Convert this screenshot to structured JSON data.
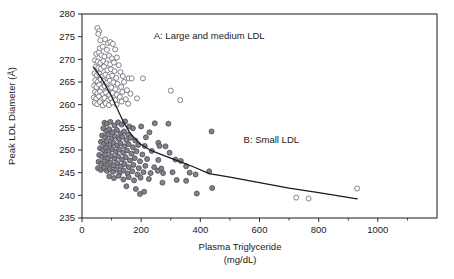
{
  "chart_data": {
    "type": "scatter",
    "title": "",
    "xlabel": "Plasma Triglyceride",
    "xlabel_units": "(mg/dL)",
    "ylabel": "Peak LDL Diameter (Å)",
    "xlim": [
      0,
      1200
    ],
    "ylim": [
      235,
      280
    ],
    "grid": false,
    "legend_position": "none",
    "x_ticks": [
      0,
      200,
      400,
      600,
      800,
      1000
    ],
    "x_tick_labels": [
      "0",
      "200",
      "400",
      "600",
      "800",
      "1000"
    ],
    "x_minor_ticks": [
      100,
      300,
      500,
      700,
      900,
      1100
    ],
    "y_ticks": [
      235,
      240,
      245,
      250,
      255,
      260,
      265,
      270,
      275,
      280
    ],
    "y_tick_labels": [
      "235",
      "240",
      "245",
      "250",
      "255",
      "260",
      "265",
      "270",
      "275",
      "280"
    ],
    "annotations": [
      {
        "text": "A: Large and medium LDL",
        "x": 430,
        "y": 274.5
      },
      {
        "text": "B: Small LDL",
        "x": 640,
        "y": 251.5
      }
    ],
    "series": [
      {
        "name": "Phenotype A (large/medium LDL)",
        "marker": "open-circle",
        "marker_color": "#ffffff",
        "marker_edge_color": "#6e6e76",
        "points": [
          [
            52,
            276.9
          ],
          [
            58,
            276.2
          ],
          [
            55,
            275.6
          ],
          [
            62,
            274.2
          ],
          [
            78,
            274.4
          ],
          [
            88,
            273.6
          ],
          [
            96,
            273.8
          ],
          [
            104,
            273.4
          ],
          [
            60,
            272.4
          ],
          [
            70,
            272.8
          ],
          [
            84,
            272.1
          ],
          [
            112,
            272.2
          ],
          [
            48,
            271.2
          ],
          [
            57,
            271.5
          ],
          [
            66,
            270.9
          ],
          [
            76,
            270.6
          ],
          [
            92,
            270.8
          ],
          [
            101,
            270.2
          ],
          [
            118,
            270.4
          ],
          [
            44,
            269.8
          ],
          [
            53,
            269.5
          ],
          [
            62,
            269.2
          ],
          [
            72,
            269.6
          ],
          [
            83,
            269.1
          ],
          [
            95,
            268.9
          ],
          [
            108,
            269.3
          ],
          [
            124,
            268.7
          ],
          [
            46,
            268.3
          ],
          [
            55,
            268.1
          ],
          [
            64,
            267.9
          ],
          [
            74,
            268.4
          ],
          [
            86,
            267.6
          ],
          [
            98,
            267.8
          ],
          [
            110,
            267.4
          ],
          [
            130,
            267.2
          ],
          [
            42,
            266.9
          ],
          [
            50,
            266.5
          ],
          [
            59,
            266.8
          ],
          [
            68,
            266.2
          ],
          [
            79,
            266.6
          ],
          [
            90,
            266.1
          ],
          [
            102,
            266.4
          ],
          [
            116,
            265.9
          ],
          [
            138,
            266.3
          ],
          [
            158,
            265.8
          ],
          [
            45,
            265.4
          ],
          [
            54,
            265.1
          ],
          [
            63,
            265.6
          ],
          [
            73,
            265.2
          ],
          [
            84,
            264.8
          ],
          [
            94,
            265.3
          ],
          [
            106,
            264.9
          ],
          [
            120,
            264.6
          ],
          [
            142,
            265.0
          ],
          [
            168,
            265.8
          ],
          [
            41,
            264.2
          ],
          [
            49,
            263.9
          ],
          [
            58,
            264.4
          ],
          [
            67,
            263.7
          ],
          [
            77,
            264.1
          ],
          [
            88,
            263.5
          ],
          [
            99,
            263.8
          ],
          [
            113,
            263.4
          ],
          [
            132,
            263.9
          ],
          [
            152,
            263.2
          ],
          [
            44,
            262.8
          ],
          [
            52,
            262.5
          ],
          [
            61,
            262.9
          ],
          [
            71,
            262.3
          ],
          [
            81,
            262.7
          ],
          [
            92,
            262.1
          ],
          [
            104,
            262.6
          ],
          [
            118,
            262.2
          ],
          [
            136,
            262.8
          ],
          [
            164,
            262.4
          ],
          [
            40,
            261.6
          ],
          [
            48,
            261.3
          ],
          [
            57,
            261.8
          ],
          [
            66,
            261.1
          ],
          [
            76,
            261.5
          ],
          [
            87,
            260.9
          ],
          [
            98,
            261.4
          ],
          [
            112,
            261.0
          ],
          [
            128,
            261.7
          ],
          [
            148,
            261.2
          ],
          [
            186,
            261.4
          ],
          [
            43,
            260.4
          ],
          [
            51,
            260.1
          ],
          [
            60,
            260.6
          ],
          [
            70,
            259.8
          ],
          [
            80,
            260.3
          ],
          [
            91,
            259.9
          ],
          [
            103,
            260.5
          ],
          [
            117,
            260.0
          ],
          [
            134,
            260.7
          ],
          [
            156,
            260.2
          ],
          [
            300,
            263.1
          ],
          [
            332,
            261.0
          ],
          [
            206,
            265.8
          ],
          [
            724,
            239.5
          ],
          [
            766,
            239.3
          ],
          [
            930,
            241.5
          ]
        ]
      },
      {
        "name": "Phenotype B (small LDL)",
        "marker": "filled-circle",
        "marker_color": "#82828c",
        "marker_edge_color": "#4a4a52",
        "points": [
          [
            76,
            256.0
          ],
          [
            84,
            255.8
          ],
          [
            96,
            256.2
          ],
          [
            110,
            255.4
          ],
          [
            122,
            256.1
          ],
          [
            134,
            255.6
          ],
          [
            146,
            256.3
          ],
          [
            160,
            255.2
          ],
          [
            246,
            255.9
          ],
          [
            292,
            255.8
          ],
          [
            72,
            254.8
          ],
          [
            82,
            254.2
          ],
          [
            92,
            254.6
          ],
          [
            104,
            253.9
          ],
          [
            118,
            254.4
          ],
          [
            130,
            253.6
          ],
          [
            142,
            254.1
          ],
          [
            156,
            253.4
          ],
          [
            172,
            254.8
          ],
          [
            200,
            255.2
          ],
          [
            228,
            253.9
          ],
          [
            438,
            254.1
          ],
          [
            68,
            253.2
          ],
          [
            78,
            252.8
          ],
          [
            88,
            253.4
          ],
          [
            100,
            252.6
          ],
          [
            112,
            253.0
          ],
          [
            124,
            252.4
          ],
          [
            136,
            252.9
          ],
          [
            150,
            252.2
          ],
          [
            164,
            252.7
          ],
          [
            180,
            252.1
          ],
          [
            216,
            252.8
          ],
          [
            258,
            251.6
          ],
          [
            64,
            251.8
          ],
          [
            74,
            251.4
          ],
          [
            84,
            251.9
          ],
          [
            95,
            251.2
          ],
          [
            106,
            251.6
          ],
          [
            118,
            251.0
          ],
          [
            130,
            251.5
          ],
          [
            143,
            250.8
          ],
          [
            157,
            251.3
          ],
          [
            172,
            250.6
          ],
          [
            190,
            251.1
          ],
          [
            212,
            250.9
          ],
          [
            262,
            250.9
          ],
          [
            282,
            250.8
          ],
          [
            61,
            250.4
          ],
          [
            71,
            250.0
          ],
          [
            81,
            250.5
          ],
          [
            91,
            249.8
          ],
          [
            102,
            250.2
          ],
          [
            114,
            249.6
          ],
          [
            126,
            250.1
          ],
          [
            139,
            249.4
          ],
          [
            152,
            249.9
          ],
          [
            167,
            249.2
          ],
          [
            184,
            249.7
          ],
          [
            204,
            249.0
          ],
          [
            236,
            249.8
          ],
          [
            296,
            249.4
          ],
          [
            58,
            248.9
          ],
          [
            68,
            248.5
          ],
          [
            78,
            249.0
          ],
          [
            88,
            248.2
          ],
          [
            99,
            248.7
          ],
          [
            110,
            248.1
          ],
          [
            122,
            248.6
          ],
          [
            135,
            247.9
          ],
          [
            148,
            248.4
          ],
          [
            162,
            247.7
          ],
          [
            178,
            248.2
          ],
          [
            196,
            247.5
          ],
          [
            220,
            248.0
          ],
          [
            258,
            247.8
          ],
          [
            316,
            247.9
          ],
          [
            334,
            247.6
          ],
          [
            56,
            247.4
          ],
          [
            66,
            247.0
          ],
          [
            76,
            247.5
          ],
          [
            86,
            246.8
          ],
          [
            96,
            247.2
          ],
          [
            107,
            246.6
          ],
          [
            119,
            247.1
          ],
          [
            131,
            246.4
          ],
          [
            144,
            246.9
          ],
          [
            158,
            246.2
          ],
          [
            174,
            246.7
          ],
          [
            192,
            246.0
          ],
          [
            214,
            246.5
          ],
          [
            244,
            246.2
          ],
          [
            268,
            245.9
          ],
          [
            352,
            246.4
          ],
          [
            54,
            246.0
          ],
          [
            64,
            245.6
          ],
          [
            74,
            246.1
          ],
          [
            84,
            245.4
          ],
          [
            94,
            245.8
          ],
          [
            105,
            245.2
          ],
          [
            116,
            245.7
          ],
          [
            128,
            245.0
          ],
          [
            140,
            245.5
          ],
          [
            154,
            244.8
          ],
          [
            170,
            245.3
          ],
          [
            188,
            244.6
          ],
          [
            208,
            245.1
          ],
          [
            232,
            244.9
          ],
          [
            256,
            245.4
          ],
          [
            274,
            244.9
          ],
          [
            306,
            245.1
          ],
          [
            364,
            245.0
          ],
          [
            384,
            244.6
          ],
          [
            430,
            245.3
          ],
          [
            92,
            244.2
          ],
          [
            108,
            243.8
          ],
          [
            124,
            244.3
          ],
          [
            140,
            243.5
          ],
          [
            158,
            244.0
          ],
          [
            176,
            243.3
          ],
          [
            198,
            243.9
          ],
          [
            226,
            243.6
          ],
          [
            272,
            242.8
          ],
          [
            320,
            243.4
          ],
          [
            352,
            243.2
          ],
          [
            150,
            242.0
          ],
          [
            182,
            241.4
          ],
          [
            196,
            240.3
          ],
          [
            210,
            240.8
          ],
          [
            388,
            240.4
          ],
          [
            440,
            241.6
          ]
        ]
      }
    ],
    "trend_line": {
      "name": "fitted curve",
      "color": "#1a1a1a",
      "points": [
        [
          40,
          268.2
        ],
        [
          60,
          266.4
        ],
        [
          80,
          264.2
        ],
        [
          100,
          261.8
        ],
        [
          120,
          259.0
        ],
        [
          140,
          256.2
        ],
        [
          160,
          254.0
        ],
        [
          180,
          252.4
        ],
        [
          200,
          251.2
        ],
        [
          230,
          250.0
        ],
        [
          260,
          249.2
        ],
        [
          300,
          248.2
        ],
        [
          340,
          247.2
        ],
        [
          380,
          246.2
        ],
        [
          430,
          244.8
        ],
        [
          500,
          244.0
        ],
        [
          600,
          242.8
        ],
        [
          700,
          241.6
        ],
        [
          800,
          240.6
        ],
        [
          930,
          239.2
        ]
      ]
    }
  }
}
